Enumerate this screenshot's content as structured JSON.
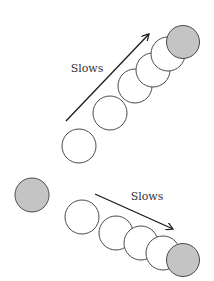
{
  "colors": {
    "stroke": "#4a4a4a",
    "open_fill": "#ffffff",
    "filled_fill": "#c4c4c4",
    "arrow": "#1a1a1a",
    "text": "#333333"
  },
  "top_path": {
    "label": "Slows",
    "label_pos": [
      87,
      72
    ],
    "arrow": {
      "from": [
        66,
        121
      ],
      "to": [
        149,
        34
      ]
    },
    "circles": [
      {
        "cx": 79,
        "cy": 146,
        "r": 17,
        "filled": false
      },
      {
        "cx": 110,
        "cy": 113,
        "r": 17,
        "filled": false
      },
      {
        "cx": 135,
        "cy": 86,
        "r": 17,
        "filled": false
      },
      {
        "cx": 153,
        "cy": 70,
        "r": 17,
        "filled": false
      },
      {
        "cx": 168,
        "cy": 54,
        "r": 17,
        "filled": false
      },
      {
        "cx": 183,
        "cy": 42,
        "r": 16.5,
        "filled": true
      }
    ]
  },
  "bottom_path": {
    "label": "Slows",
    "label_pos": [
      147,
      200
    ],
    "start_ball": {
      "cx": 32,
      "cy": 195,
      "r": 17,
      "filled": true
    },
    "arrow": {
      "from": [
        95,
        194
      ],
      "to": [
        173,
        229
      ]
    },
    "circles": [
      {
        "cx": 82,
        "cy": 217,
        "r": 17,
        "filled": false
      },
      {
        "cx": 116,
        "cy": 233,
        "r": 17,
        "filled": false
      },
      {
        "cx": 141,
        "cy": 243,
        "r": 17,
        "filled": false
      },
      {
        "cx": 163,
        "cy": 253,
        "r": 17,
        "filled": false
      },
      {
        "cx": 183,
        "cy": 260,
        "r": 16.5,
        "filled": true
      }
    ]
  }
}
